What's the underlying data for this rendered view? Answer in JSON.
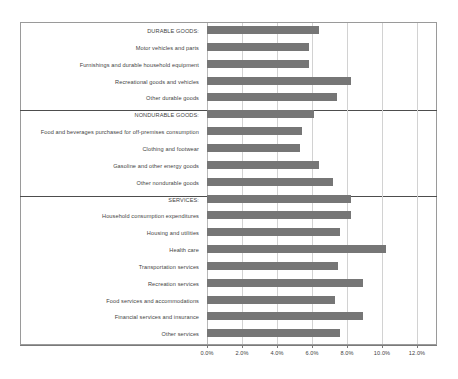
{
  "chart_data": {
    "type": "bar",
    "orientation": "horizontal",
    "title": "",
    "subtitle": "",
    "xlabel": "",
    "ylabel": "",
    "xlim": [
      0,
      12
    ],
    "xticks": [
      "0.0%",
      "2.0%",
      "4.0%",
      "6.0%",
      "8.0%",
      "10.0%",
      "12.0%"
    ],
    "xtick_values": [
      0,
      2,
      4,
      6,
      8,
      10,
      12
    ],
    "grid": true,
    "legend": "none",
    "value_unit": "%",
    "bar_color": "#767676",
    "gridline_color": "#d2d2d2",
    "frame_color": "#9a9a9a",
    "divider_color": "#4d4d4d",
    "groups": [
      {
        "name": "DURABLE GOODS",
        "categories": [
          "DURABLE GOODS:",
          "Motor vehicles and parts",
          "Furnishings and durable household equipment",
          "Recreational goods and vehicles",
          "Other durable goods"
        ],
        "values": [
          6.4,
          5.8,
          5.8,
          8.2,
          7.4
        ]
      },
      {
        "name": "NONDURABLE GOODS",
        "categories": [
          "NONDURABLE GOODS:",
          "Food and beverages purchased for off-premises consumption",
          "Clothing and footwear",
          "Gasoline and other energy goods",
          "Other nondurable goods"
        ],
        "values": [
          6.1,
          5.4,
          5.3,
          6.4,
          7.2
        ]
      },
      {
        "name": "SERVICES",
        "categories": [
          "SERVICES:",
          "Household consumption expenditures",
          "Housing and utilities",
          "Health care",
          "Transportation services",
          "Recreation services",
          "Food services and accommodations",
          "Financial services and insurance",
          "Other services"
        ],
        "values": [
          8.2,
          8.2,
          7.6,
          10.2,
          7.5,
          8.9,
          7.3,
          8.9,
          7.6
        ]
      }
    ],
    "categories": [
      "DURABLE GOODS:",
      "Motor vehicles and parts",
      "Furnishings and durable household equipment",
      "Recreational goods and vehicles",
      "Other durable goods",
      "NONDURABLE GOODS:",
      "Food and beverages purchased for off-premises consumption",
      "Clothing and footwear",
      "Gasoline and other energy goods",
      "Other nondurable goods",
      "SERVICES:",
      "Household consumption expenditures",
      "Housing and utilities",
      "Health care",
      "Transportation services",
      "Recreation services",
      "Food services and accommodations",
      "Financial services and insurance",
      "Other services"
    ],
    "values": [
      6.4,
      5.8,
      5.8,
      8.2,
      7.4,
      6.1,
      5.4,
      5.3,
      6.4,
      7.2,
      8.2,
      8.2,
      7.6,
      10.2,
      7.5,
      8.9,
      7.3,
      8.9,
      7.6
    ]
  }
}
